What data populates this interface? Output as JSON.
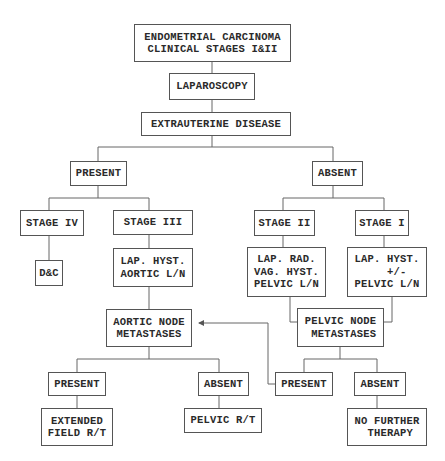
{
  "diagram": {
    "type": "flowchart",
    "title": "ENDOMETRIAL CARCINOMA\nCLINICAL STAGES I&II",
    "nodes": {
      "root": "ENDOMETRIAL CARCINOMA\nCLINICAL STAGES I&II",
      "laparoscopy": "LAPAROSCOPY",
      "extrauterine": "EXTRAUTERINE DISEASE",
      "present_top": "PRESENT",
      "absent_top": "ABSENT",
      "stage_iv": "STAGE IV",
      "stage_iii": "STAGE III",
      "stage_ii": "STAGE II",
      "stage_i": "STAGE I",
      "dc": "D&C",
      "lap_hyst_aortic": "LAP. HYST.\nAORTIC L/N",
      "lap_rad_vag": "LAP. RAD.\nVAG. HYST.\nPELVIC L/N",
      "lap_hyst_pelvic": "LAP. HYST.\n   +/-\nPELVIC L/N",
      "aortic_node": "AORTIC NODE\nMETASTASES",
      "pelvic_node": "PELVIC NODE\n METASTASES",
      "aortic_present": "PRESENT",
      "aortic_absent": "ABSENT",
      "pelvic_present": "PRESENT",
      "pelvic_absent": "ABSENT",
      "extended_field": "EXTENDED\nFIELD R/T",
      "pelvic_rt": "PELVIC R/T",
      "no_further": "NO FURTHER\n THERAPY"
    },
    "edges": [
      [
        "root",
        "laparoscopy"
      ],
      [
        "laparoscopy",
        "extrauterine"
      ],
      [
        "extrauterine",
        "present_top"
      ],
      [
        "extrauterine",
        "absent_top"
      ],
      [
        "present_top",
        "stage_iv"
      ],
      [
        "present_top",
        "stage_iii"
      ],
      [
        "absent_top",
        "stage_ii"
      ],
      [
        "absent_top",
        "stage_i"
      ],
      [
        "stage_iv",
        "dc"
      ],
      [
        "stage_iii",
        "lap_hyst_aortic"
      ],
      [
        "stage_ii",
        "lap_rad_vag"
      ],
      [
        "stage_i",
        "lap_hyst_pelvic"
      ],
      [
        "lap_hyst_aortic",
        "aortic_node"
      ],
      [
        "lap_rad_vag",
        "pelvic_node"
      ],
      [
        "lap_hyst_pelvic",
        "pelvic_node"
      ],
      [
        "aortic_node",
        "aortic_present"
      ],
      [
        "aortic_node",
        "aortic_absent"
      ],
      [
        "pelvic_node",
        "pelvic_present"
      ],
      [
        "pelvic_node",
        "pelvic_absent"
      ],
      [
        "pelvic_present",
        "aortic_node",
        "arrow"
      ],
      [
        "aortic_present",
        "extended_field"
      ],
      [
        "aortic_absent",
        "pelvic_rt"
      ],
      [
        "pelvic_absent",
        "no_further"
      ]
    ],
    "colors": {
      "background": "#ffffff",
      "border": "#555555",
      "line": "#666666",
      "text": "#2a2a2a"
    }
  }
}
